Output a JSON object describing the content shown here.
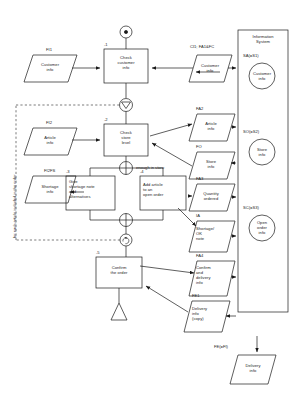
{
  "diagram": {
    "title_note": "Order handling process flow with information system",
    "vertical_note": "for each article included in the order",
    "branch_label": "enough in store",
    "system_column": {
      "name": "Information\nSystem",
      "stores": [
        {
          "tag": "SA(=S1)",
          "label": "Customer\ninfo"
        },
        {
          "tag": "SO(=S2)",
          "label": "Store\ninfo"
        },
        {
          "tag": "SC(=S3)",
          "label": "Open\norder\ninfo"
        }
      ]
    },
    "activities": [
      {
        "num": "-1",
        "label": "Check\ncustomer\ninfo"
      },
      {
        "num": "-2",
        "label": "Check\nstore\nlevel"
      },
      {
        "num": "-3",
        "label": "Give\nshortage note\nand\nalternatives"
      },
      {
        "num": "-4",
        "label": "Add article\nto an\nopen order"
      },
      {
        "num": "-5",
        "label": "Confirm\nthe order"
      }
    ],
    "documents": [
      {
        "tag": "FI1",
        "label": "Customer\ninfo"
      },
      {
        "tag": "CI1; FA1&FC",
        "label": "Customer\ninfo"
      },
      {
        "tag": "FI2",
        "label": "Article\ninfo"
      },
      {
        "tag": "FA2",
        "label": "Article\ninfo"
      },
      {
        "tag": "FO",
        "label": "Store\ninfo"
      },
      {
        "tag": "FI2FS",
        "label": "Shortage\ninfo"
      },
      {
        "tag": "FA3",
        "label": "Quantity\nordered"
      },
      {
        "tag": "IA",
        "label": "Shortage/\nOK\nnote"
      },
      {
        "tag": "FA4",
        "label": "Confirm\nand\ndelivery\ninfo"
      },
      {
        "tag": "FE1",
        "label": "Delivery\ninfo\n(copy)"
      },
      {
        "tag": "FE(=FI)",
        "label": "Delivery\ninfo"
      }
    ],
    "connectors": [
      {
        "name": "start-node",
        "symbol": "●"
      },
      {
        "name": "decision-node",
        "symbol": "∇"
      },
      {
        "name": "split-node",
        "symbol": "⊕"
      },
      {
        "name": "merge-node",
        "symbol": "⊕"
      },
      {
        "name": "loop-node",
        "symbol": "↺"
      },
      {
        "name": "end-node",
        "symbol": "△"
      }
    ],
    "colors": {
      "ink": "#1a1a1a",
      "paper": "#ffffff",
      "dash": "#444444"
    }
  }
}
